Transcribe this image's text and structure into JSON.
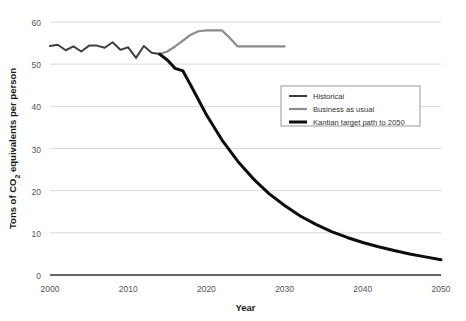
{
  "chart_data": {
    "type": "line",
    "title": "",
    "xlabel": "Year",
    "ylabel": "Tons of CO2 equivalents per person",
    "ylabel_display": "Tons of CO₂ equivalents per person",
    "xlim": [
      2000,
      2050
    ],
    "ylim": [
      0,
      60
    ],
    "xticks": [
      2000,
      2010,
      2020,
      2030,
      2040,
      2050
    ],
    "yticks": [
      0,
      10,
      20,
      30,
      40,
      50,
      60
    ],
    "grid": "horizontal",
    "legend_position": "center-right",
    "series": [
      {
        "name": "Historical",
        "color": "#404040",
        "width": 2.0,
        "x": [
          2000,
          2001,
          2002,
          2003,
          2004,
          2005,
          2006,
          2007,
          2008,
          2009,
          2010,
          2011,
          2012,
          2013,
          2014
        ],
        "y": [
          54.3,
          54.6,
          53.3,
          54.2,
          53.0,
          54.4,
          54.4,
          53.9,
          55.2,
          53.4,
          54.0,
          51.5,
          54.3,
          52.7,
          52.4
        ]
      },
      {
        "name": "Business as usual",
        "color": "#8c8c8c",
        "width": 2.2,
        "x": [
          2014,
          2015,
          2016,
          2017,
          2018,
          2019,
          2020,
          2021,
          2022,
          2023,
          2024,
          2030
        ],
        "y": [
          52.4,
          53.0,
          54.2,
          55.6,
          57.0,
          57.8,
          58.0,
          58.0,
          58.0,
          56.2,
          54.2,
          54.2
        ]
      },
      {
        "name": "Kantian target path to 2050",
        "color": "#0d0d0d",
        "width": 3.0,
        "x": [
          2014,
          2015,
          2016,
          2017,
          2018,
          2019,
          2020,
          2022,
          2024,
          2026,
          2028,
          2030,
          2032,
          2034,
          2036,
          2038,
          2040,
          2042,
          2044,
          2046,
          2048,
          2050
        ],
        "y": [
          52.4,
          51.0,
          49.0,
          48.4,
          45.0,
          41.5,
          38.0,
          32.0,
          27.0,
          22.8,
          19.3,
          16.5,
          14.0,
          12.0,
          10.3,
          8.9,
          7.7,
          6.7,
          5.8,
          5.0,
          4.3,
          3.6
        ]
      }
    ],
    "legend_entries": [
      {
        "label": "Historical",
        "color": "#404040",
        "width": 2.0
      },
      {
        "label": "Business as usual",
        "color": "#8c8c8c",
        "width": 2.2
      },
      {
        "label": "Kantian target path to 2050",
        "color": "#0d0d0d",
        "width": 3.0
      }
    ]
  },
  "colors": {
    "background": "#ffffff",
    "grid": "#d9d9d9",
    "axis": "#333333",
    "tick_text": "#555555",
    "axis_title": "#1a1a1a",
    "legend_border": "#999999"
  }
}
